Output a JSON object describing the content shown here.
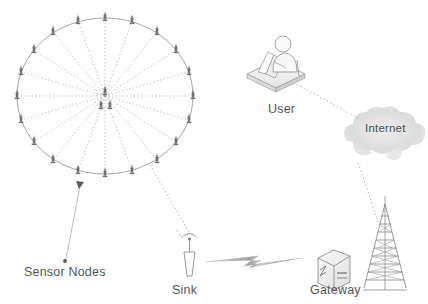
{
  "figure": {
    "background_color": "#ffffff",
    "width": 428,
    "height": 304
  },
  "palette": {
    "stroke_grey": "#8a8a8a",
    "node_grey": "#6b6b6b",
    "dotted_grey": "#9b9b9b",
    "cloud_grey": "#d9d9d9",
    "text_grey": "#555555",
    "icon_fill": "#f2f2f2",
    "icon_line": "#9a9a9a",
    "bolt_grey": "#bdbdbd"
  },
  "labels": {
    "sensor_nodes": "Sensor Nodes",
    "sink": "Sink",
    "gateway": "Gateway",
    "user": "User",
    "internet": "Internet"
  },
  "icon_names": {
    "sensor_node": "sensor-node-icon",
    "sink": "sink-antenna-icon",
    "gateway": "gateway-server-icon",
    "tower": "radio-tower-icon",
    "user": "user-at-desk-icon",
    "cloud": "internet-cloud-icon",
    "bolt": "wireless-link-bolt-icon",
    "leader": "leader-arrow-icon"
  },
  "cluster": {
    "name": "sensor-node-cluster",
    "center": {
      "x": 105,
      "y": 96
    },
    "radius_x": 88,
    "radius_y": 78,
    "spoke_count": 20,
    "perimeter_node_count": 20,
    "center_node_count": 3,
    "spoke_style": "dotted",
    "boundary_style": "solid-thin"
  },
  "connections": [
    {
      "name": "cluster-to-sink",
      "from": "sensor-node-cluster",
      "to": "sink",
      "style": "dotted"
    },
    {
      "name": "sink-to-gateway",
      "from": "sink",
      "to": "gateway",
      "style": "wireless-bolt"
    },
    {
      "name": "tower-to-internet",
      "from": "radio-tower",
      "to": "internet",
      "style": "dotted"
    },
    {
      "name": "internet-to-user",
      "from": "internet",
      "to": "user",
      "style": "dotted"
    },
    {
      "name": "cluster-leader-line",
      "from": "sensor-node-cluster",
      "to": "sensor-nodes-label",
      "style": "solid-arrow"
    }
  ]
}
